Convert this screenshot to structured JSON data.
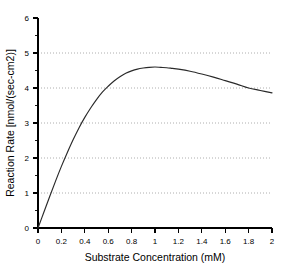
{
  "chart_data": {
    "type": "line",
    "title": "",
    "xlabel": "Substrate Concentration (mM)",
    "ylabel": "Reaction Rate [nmol/(sec-cm2)]",
    "xlim": [
      0,
      2
    ],
    "ylim": [
      0,
      6
    ],
    "grid": true,
    "grid_axis": "y",
    "grid_values": [
      1,
      2,
      3,
      4,
      5
    ],
    "legend": "none",
    "xticks": [
      0,
      0.2,
      0.4,
      0.6,
      0.8,
      1,
      1.2,
      1.4,
      1.6,
      1.8,
      2
    ],
    "xtick_labels": [
      "0",
      "0.2",
      "0.4",
      "0.6",
      "0.8",
      "1",
      "1.2",
      "1.4",
      "1.6",
      "1.8",
      "2"
    ],
    "yticks": [
      0,
      1,
      2,
      3,
      4,
      5,
      6
    ],
    "ytick_labels": [
      "0",
      "1",
      "2",
      "3",
      "4",
      "5",
      "6"
    ],
    "y_minor_ticks": [
      0.5,
      1.5,
      2.5,
      3.5,
      4.5,
      5.5
    ],
    "series": [
      {
        "name": "Reaction Rate",
        "color": "#2a2a2a",
        "x": [
          0,
          0.05,
          0.1,
          0.15,
          0.2,
          0.25,
          0.3,
          0.35,
          0.4,
          0.45,
          0.5,
          0.55,
          0.6,
          0.65,
          0.7,
          0.75,
          0.8,
          0.85,
          0.9,
          0.95,
          1.0,
          1.05,
          1.1,
          1.15,
          1.2,
          1.3,
          1.4,
          1.5,
          1.6,
          1.7,
          1.8,
          1.9,
          2.0
        ],
        "y": [
          0.0,
          0.45,
          0.9,
          1.34,
          1.76,
          2.15,
          2.52,
          2.86,
          3.16,
          3.43,
          3.67,
          3.88,
          4.05,
          4.2,
          4.32,
          4.42,
          4.49,
          4.54,
          4.57,
          4.59,
          4.6,
          4.59,
          4.58,
          4.56,
          4.54,
          4.48,
          4.4,
          4.31,
          4.21,
          4.11,
          4.0,
          3.93,
          3.86
        ]
      }
    ]
  }
}
